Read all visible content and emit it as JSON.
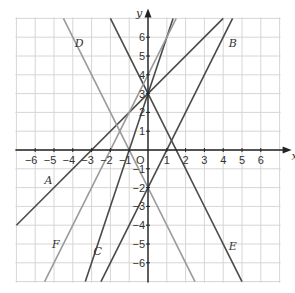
{
  "figure": {
    "axis_labels": {
      "x": "x",
      "y": "y",
      "origin": "O"
    },
    "x_ticks": [
      "-6",
      "-5",
      "-4",
      "-3",
      "-2",
      "-1",
      "1",
      "2",
      "3",
      "4",
      "5",
      "6"
    ],
    "y_ticks": [
      "6",
      "5",
      "4",
      "3",
      "2",
      "1",
      "-1",
      "-2",
      "-3",
      "-4",
      "-5",
      "-6"
    ],
    "range": {
      "xmin": -7,
      "xmax": 7,
      "ymin": -7,
      "ymax": 7
    },
    "colors": {
      "grid": "#d6d6d6",
      "axis": "#222222",
      "line_dark": "#4a4a4a",
      "line_light": "#9a9a9a"
    }
  },
  "chart_data": {
    "type": "line",
    "title": "",
    "xlabel": "x",
    "ylabel": "y",
    "xlim": [
      -7,
      7
    ],
    "ylim": [
      -7,
      7
    ],
    "grid": true,
    "series": [
      {
        "name": "A",
        "equation": "y = x + 3",
        "m": 1,
        "c": 3,
        "label_pos": [
          -5.5,
          -1.8
        ],
        "shade": "dark"
      },
      {
        "name": "B",
        "equation": "y = 2x - 2",
        "m": 2,
        "c": -2,
        "label_pos": [
          4.3,
          5.5
        ],
        "shade": "dark"
      },
      {
        "name": "C",
        "equation": "y = 3x + 3",
        "m": 3,
        "c": 3,
        "label_pos": [
          -2.9,
          -5.6
        ],
        "shade": "dark"
      },
      {
        "name": "D",
        "equation": "y = -2x - 2",
        "m": -2,
        "c": -2,
        "label_pos": [
          -3.9,
          5.5
        ],
        "shade": "light"
      },
      {
        "name": "E",
        "equation": "y = -2x + 3",
        "m": -2,
        "c": 3,
        "label_pos": [
          4.3,
          -5.3
        ],
        "shade": "dark"
      },
      {
        "name": "F",
        "equation": "y = 2x + 4",
        "m": 2,
        "c": 4,
        "label_pos": [
          -5.1,
          -5.2
        ],
        "shade": "light"
      }
    ]
  }
}
